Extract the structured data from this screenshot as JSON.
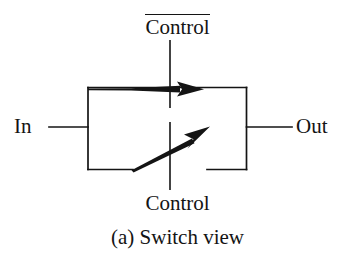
{
  "figure": {
    "caption": "(a) Switch view",
    "background_color": "#ffffff",
    "stroke_color": "#141414",
    "width": 355,
    "height": 257
  },
  "labels": {
    "control_complement": "Control",
    "control_complement_has_overline": true,
    "control": "Control",
    "input": "In",
    "output": "Out"
  },
  "diagram": {
    "type": "transmission-gate-switch-symbol",
    "body_rect": {
      "x": 87,
      "y": 87,
      "width": 160,
      "height": 83
    },
    "bottom_edge_gap": {
      "left_end": 132,
      "right_start": 207
    },
    "input_wire": {
      "x1": 48,
      "y1": 127,
      "x2": 87,
      "y2": 127
    },
    "output_wire": {
      "x1": 247,
      "y1": 127,
      "x2": 292,
      "y2": 127
    },
    "top_control_stem": {
      "x": 170,
      "y1": 40,
      "y2": 108
    },
    "bottom_control_stem": {
      "x": 170,
      "y1": 122,
      "y2": 190
    },
    "top_arrow": {
      "x1": 87,
      "y1": 89,
      "x2": 203,
      "y2": 89,
      "direction": "right",
      "tapered": true
    },
    "switch_blade_arrow": {
      "x1": 132,
      "y1": 168,
      "x2": 209,
      "y2": 128,
      "direction": "up-right"
    }
  }
}
